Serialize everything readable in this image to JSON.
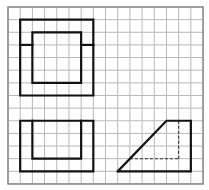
{
  "grid": {
    "cols": 16,
    "rows": 14,
    "origin_x": 8,
    "origin_y": 7,
    "cell_w": 12.19,
    "cell_h": 12.64,
    "line_color": "#b8b8b8",
    "border_color": "#8a8a8a"
  },
  "figures": [
    {
      "name": "top-view",
      "solid": [
        [
          [
            1,
            1
          ],
          [
            7,
            1
          ],
          [
            7,
            7
          ],
          [
            1,
            7
          ],
          [
            1,
            1
          ]
        ],
        [
          [
            2,
            2
          ],
          [
            6,
            2
          ],
          [
            6,
            6
          ],
          [
            2,
            6
          ],
          [
            2,
            2
          ]
        ],
        [
          [
            1,
            3
          ],
          [
            2,
            3
          ]
        ],
        [
          [
            6,
            3
          ],
          [
            7,
            3
          ]
        ]
      ],
      "dashed": []
    },
    {
      "name": "front-view",
      "solid": [
        [
          [
            1,
            9
          ],
          [
            7,
            9
          ],
          [
            7,
            13
          ],
          [
            1,
            13
          ],
          [
            1,
            9
          ]
        ],
        [
          [
            2,
            9
          ],
          [
            2,
            12
          ],
          [
            6,
            12
          ],
          [
            6,
            9
          ]
        ]
      ],
      "dashed": []
    },
    {
      "name": "side-view",
      "solid": [
        [
          [
            9,
            13
          ],
          [
            13,
            9
          ],
          [
            15,
            9
          ],
          [
            15,
            13
          ],
          [
            9,
            13
          ]
        ]
      ],
      "dashed": [
        [
          [
            14,
            9
          ],
          [
            14,
            12
          ]
        ],
        [
          [
            10,
            12
          ],
          [
            14,
            12
          ]
        ]
      ]
    }
  ],
  "colors": {
    "stroke": "#111111",
    "dashed": "#333333",
    "background": "#ffffff"
  }
}
